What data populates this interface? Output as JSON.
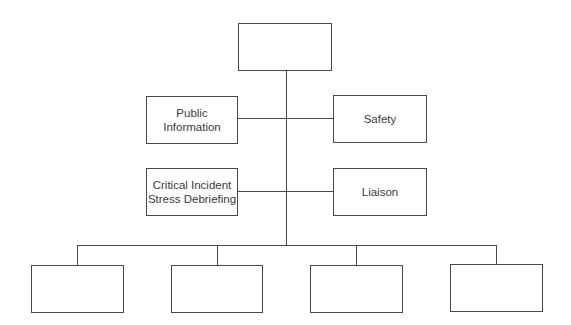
{
  "diagram": {
    "type": "org-chart",
    "line_color": "#4a4a4a",
    "top": {
      "label": ""
    },
    "staff_left": [
      {
        "label": "Public Information"
      },
      {
        "label": "Critical Incident Stress Debriefing"
      }
    ],
    "staff_right": [
      {
        "label": "Safety"
      },
      {
        "label": "Liaison"
      }
    ],
    "sections": [
      {
        "label": ""
      },
      {
        "label": ""
      },
      {
        "label": ""
      },
      {
        "label": ""
      }
    ]
  }
}
